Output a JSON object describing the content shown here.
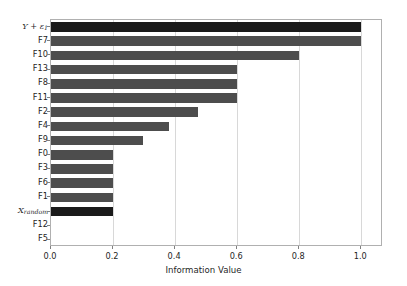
{
  "chart_data": {
    "type": "bar",
    "orientation": "horizontal",
    "title": "",
    "xlabel": "Information Value",
    "ylabel": "",
    "xlim": [
      0.0,
      1.07
    ],
    "xticks": [
      "0.0",
      "0.2",
      "0.4",
      "0.6",
      "0.8",
      "1.0"
    ],
    "xtick_values": [
      0.0,
      0.2,
      0.4,
      0.6,
      0.8,
      1.0
    ],
    "grid": "vertical",
    "legend": "none",
    "categories": [
      "Y + ε₁",
      "F7",
      "F10",
      "F13",
      "F8",
      "F11",
      "F2",
      "F4",
      "F9",
      "F0",
      "F3",
      "F6",
      "F1",
      "X_random",
      "F12",
      "F5"
    ],
    "category_labels_html": [
      "<span class=\"mathvar\">Y</span> + <span class=\"mathvar\">ε</span><span class=\"sub\">1</span>",
      "F7",
      "F10",
      "F13",
      "F8",
      "F11",
      "F2",
      "F4",
      "F9",
      "F0",
      "F3",
      "F6",
      "F1",
      "<span class=\"mathvar\">X</span><span class=\"sub\">random</span>",
      "F12",
      "F5"
    ],
    "values": [
      1.0,
      1.0,
      0.8,
      0.6,
      0.6,
      0.6,
      0.475,
      0.38,
      0.295,
      0.2,
      0.2,
      0.2,
      0.2,
      0.2,
      0.0,
      0.0
    ],
    "highlighted": [
      true,
      false,
      false,
      false,
      false,
      false,
      false,
      false,
      false,
      false,
      false,
      false,
      false,
      true,
      false,
      false
    ],
    "colors": {
      "bar": "#4d4d4d",
      "bar_highlight": "#1a1a1a",
      "grid": "#d8d8d8",
      "axis": "#b0b0b0",
      "text": "#1f1f1f",
      "background": "#ffffff"
    }
  }
}
